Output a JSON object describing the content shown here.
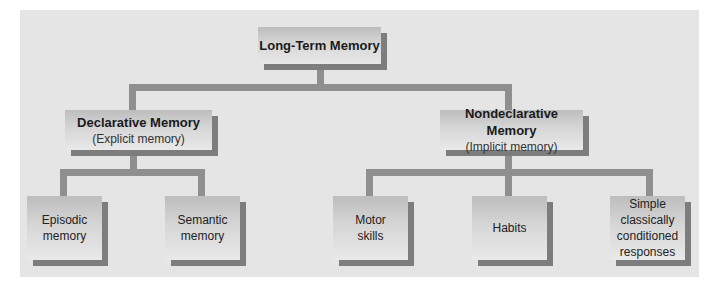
{
  "diagram": {
    "root": {
      "title": "Long-Term Memory"
    },
    "branches": [
      {
        "title": "Declarative Memory",
        "subtitle": "(Explicit memory)",
        "children": [
          {
            "label_lines": [
              "Episodic",
              "memory"
            ]
          },
          {
            "label_lines": [
              "Semantic",
              "memory"
            ]
          }
        ]
      },
      {
        "title": "Nondeclarative Memory",
        "subtitle": "(Implicit memory)",
        "children": [
          {
            "label_lines": [
              "Motor",
              "skills"
            ]
          },
          {
            "label_lines": [
              "Habits"
            ]
          },
          {
            "label_lines": [
              "Simple",
              "classically",
              "conditioned",
              "responses"
            ]
          }
        ]
      }
    ]
  },
  "colors": {
    "panel": "#e5e5e5",
    "connector": "#8f8f8f",
    "box_shadow": "#7d7d7d"
  }
}
